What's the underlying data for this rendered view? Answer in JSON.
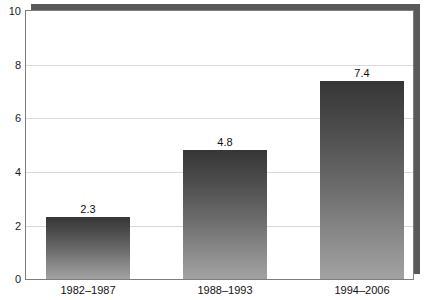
{
  "chart_data": {
    "type": "bar",
    "title": "",
    "subtitle": "",
    "xlabel": "",
    "ylabel": "",
    "categories": [
      "1982–1987",
      "1988–1993",
      "1994–2006"
    ],
    "values": [
      2.3,
      4.8,
      7.4
    ],
    "value_labels": [
      "2.3",
      "4.8",
      "7.4"
    ],
    "ylim": [
      0,
      10
    ],
    "yticks": [
      0,
      2,
      4,
      6,
      8,
      10
    ],
    "ytick_labels": [
      "0",
      "2",
      "4",
      "6",
      "8",
      "10"
    ],
    "grid": true,
    "grid_axis": "y",
    "legend": false,
    "legend_position": "none",
    "series": [
      {
        "name": "",
        "values": [
          2.3,
          4.8,
          7.4
        ]
      }
    ],
    "colors": {
      "bar_top": "#363636",
      "bar_bottom": "#a2a2a2",
      "gridline": "#d9d9d9",
      "frame": "#7d7d7d",
      "shadow": "#58595b",
      "text": "#111111",
      "background": "#ffffff"
    }
  }
}
